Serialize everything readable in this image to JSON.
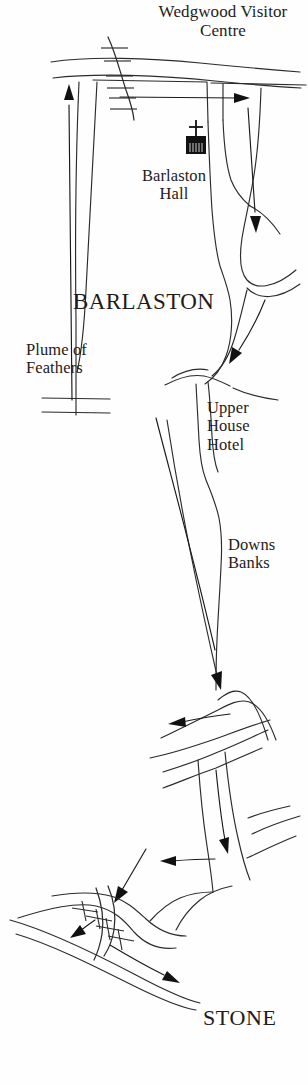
{
  "map": {
    "title": "Barlaston area route map",
    "background_color": "#fefefe",
    "ink_color": "#231f20",
    "labels": {
      "wedgwood_visitor_centre": "Wedgwood Visitor\nCentre",
      "barlaston_hall": "Barlaston\nHall",
      "barlaston": "BARLASTON",
      "plume_of_feathers": "Plume of\nFeathers",
      "upper_house_hotel": "Upper\nHouse\nHotel",
      "downs_banks": "Downs\nBanks",
      "stone": "STONE"
    },
    "symbols": [
      {
        "name": "church-icon",
        "description": "Filled square building with cross on top marking Barlaston Hall",
        "x": 188,
        "y": 128
      },
      {
        "name": "railway-line",
        "description": "Hatched railway crossing the northern roads",
        "x": 118,
        "y": 70
      },
      {
        "name": "railway-line-south",
        "description": "Hatched railway crossing the southern road to Stone",
        "x": 100,
        "y": 910
      }
    ],
    "direction_arrows": [
      {
        "name": "arrow-north",
        "description": "Northbound arrow on the western road",
        "direction": "north"
      },
      {
        "name": "arrow-east-top",
        "description": "Eastbound arrow along the northern road",
        "direction": "east"
      },
      {
        "name": "arrow-south-upper",
        "description": "Southbound arrow near Barlaston Hall",
        "direction": "south"
      },
      {
        "name": "arrow-south-mid",
        "description": "Southbound arrow above Upper House Hotel",
        "direction": "south"
      },
      {
        "name": "arrow-south-downs",
        "description": "Southbound arrow at Downs Banks junction",
        "direction": "south"
      },
      {
        "name": "arrow-west-downs",
        "description": "Westbound arrow at Downs Banks junction",
        "direction": "west"
      },
      {
        "name": "arrow-south-lower",
        "description": "Southbound arrow approaching the railway crossing",
        "direction": "south"
      },
      {
        "name": "arrow-west-lower",
        "description": "Westbound arrow on the lower link road",
        "direction": "west"
      },
      {
        "name": "arrow-southwest",
        "description": "Southwest arrow toward the railway crossing",
        "direction": "southwest"
      },
      {
        "name": "arrow-crossing",
        "description": "Arrow at the southern railway crossing",
        "direction": "southwest"
      },
      {
        "name": "arrow-stone",
        "description": "Arrow pointing toward Stone",
        "direction": "southeast"
      }
    ]
  }
}
